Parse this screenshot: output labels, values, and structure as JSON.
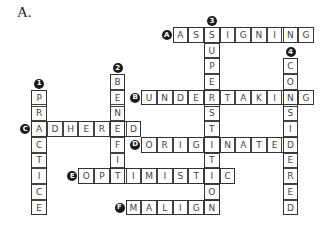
{
  "title": "A.",
  "grid": {
    "origin_x": 204,
    "origin_y": 27,
    "cell": 15.7
  },
  "words": [
    {
      "label": "A",
      "direction": "across",
      "row": 0,
      "col": -2,
      "answer": "ASSIGNING"
    },
    {
      "label": "B",
      "direction": "across",
      "row": 4,
      "col": -4,
      "answer": "UNDERTAKING"
    },
    {
      "label": "C",
      "direction": "across",
      "row": 6,
      "col": -11,
      "answer": "ADHERED"
    },
    {
      "label": "D",
      "direction": "across",
      "row": 7,
      "col": -4,
      "answer": "ORIGINATED"
    },
    {
      "label": "E",
      "direction": "across",
      "row": 9,
      "col": -8,
      "answer": "OPTIMISTIC"
    },
    {
      "label": "F",
      "direction": "across",
      "row": 11,
      "col": -5,
      "answer": "MALIGN"
    },
    {
      "label": "1",
      "direction": "down",
      "row": 4,
      "col": -11,
      "answer": "PRACTICE"
    },
    {
      "label": "2",
      "direction": "down",
      "row": 3,
      "col": -6,
      "answer": "BENEFIT"
    },
    {
      "label": "3",
      "direction": "down",
      "row": 0,
      "col": 0,
      "answer": "SUPERSTITION"
    },
    {
      "label": "4",
      "direction": "down",
      "row": 2,
      "col": 5,
      "answer": "CONSIDERED"
    }
  ]
}
